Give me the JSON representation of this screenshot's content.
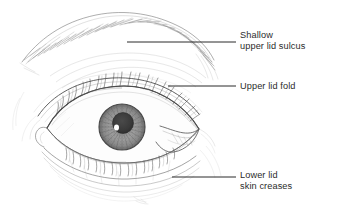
{
  "figure": {
    "background_color": "#ffffff",
    "ink_color": "#2b2b2b",
    "width": 338,
    "height": 217
  },
  "annotations": [
    {
      "id": "shallow-upper-lid-sulcus",
      "line1": "Shallow",
      "line2": "upper lid sulcus",
      "leader": {
        "x1": 127,
        "y1": 42,
        "x2": 236,
        "y2": 42
      }
    },
    {
      "id": "upper-lid-fold",
      "line1": "Upper lid fold",
      "line2": "",
      "leader": {
        "x1": 168,
        "y1": 86,
        "x2": 236,
        "y2": 86
      }
    },
    {
      "id": "lower-lid-skin-creases",
      "line1": "Lower lid",
      "line2": "skin creases",
      "leader": {
        "x1": 172,
        "y1": 177,
        "x2": 236,
        "y2": 177
      }
    }
  ],
  "drawing": {
    "style": "pencil-sketch",
    "parts": [
      "eyebrow-arch",
      "upper-lid-sulcus-crease",
      "upper-lid-fold",
      "upper-lash-line",
      "lower-lash-line",
      "iris",
      "pupil",
      "corneal-highlight",
      "outer-canthus",
      "inner-canthus",
      "lower-lid-skin-creases",
      "cheek-contour"
    ],
    "iris": {
      "cx": 122,
      "cy": 127,
      "r": 23,
      "fill": "#9a9a9a"
    },
    "pupil": {
      "cx": 123,
      "cy": 123,
      "r": 10,
      "fill": "#3a3a3a"
    },
    "highlight": {
      "cx": 116,
      "cy": 127,
      "r": 2.6,
      "fill": "#ffffff"
    }
  }
}
